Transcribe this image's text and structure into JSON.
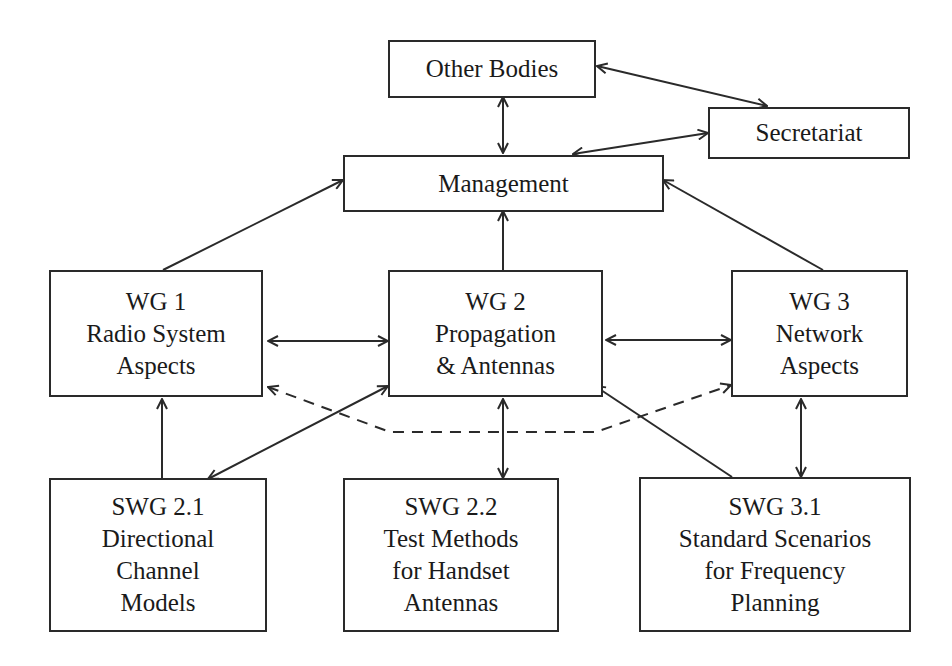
{
  "diagram": {
    "nodes": {
      "other_bodies": {
        "lines": [
          "Other Bodies"
        ]
      },
      "secretariat": {
        "lines": [
          "Secretariat"
        ]
      },
      "management": {
        "lines": [
          "Management"
        ]
      },
      "wg1": {
        "lines": [
          "WG 1",
          "Radio System",
          "Aspects"
        ]
      },
      "wg2": {
        "lines": [
          "WG 2",
          "Propagation",
          "& Antennas"
        ]
      },
      "wg3": {
        "lines": [
          "WG 3",
          "Network",
          "Aspects"
        ]
      },
      "swg21": {
        "lines": [
          "SWG 2.1",
          "Directional",
          "Channel",
          "Models"
        ]
      },
      "swg22": {
        "lines": [
          "SWG 2.2",
          "Test Methods",
          "for Handset",
          "Antennas"
        ]
      },
      "swg31": {
        "lines": [
          "SWG 3.1",
          "Standard Scenarios",
          "for Frequency",
          "Planning"
        ]
      }
    },
    "edges": [
      {
        "from": "Other Bodies",
        "to": "Secretariat",
        "style": "solid",
        "direction": "both"
      },
      {
        "from": "Other Bodies",
        "to": "Management",
        "style": "solid",
        "direction": "both"
      },
      {
        "from": "Secretariat",
        "to": "Management",
        "style": "solid",
        "direction": "both"
      },
      {
        "from": "WG 1",
        "to": "Management",
        "style": "solid",
        "direction": "forward"
      },
      {
        "from": "WG 2",
        "to": "Management",
        "style": "solid",
        "direction": "forward"
      },
      {
        "from": "WG 3",
        "to": "Management",
        "style": "solid",
        "direction": "forward"
      },
      {
        "from": "WG 1",
        "to": "WG 2",
        "style": "solid",
        "direction": "both"
      },
      {
        "from": "WG 2",
        "to": "WG 3",
        "style": "solid",
        "direction": "both"
      },
      {
        "from": "WG 1",
        "to": "WG 3",
        "style": "dashed",
        "direction": "both"
      },
      {
        "from": "SWG 2.1",
        "to": "WG 1",
        "style": "solid",
        "direction": "forward"
      },
      {
        "from": "SWG 2.1",
        "to": "WG 2",
        "style": "solid",
        "direction": "both"
      },
      {
        "from": "SWG 2.2",
        "to": "WG 2",
        "style": "solid",
        "direction": "both"
      },
      {
        "from": "SWG 3.1",
        "to": "WG 2",
        "style": "solid",
        "direction": "forward"
      },
      {
        "from": "SWG 3.1",
        "to": "WG 3",
        "style": "solid",
        "direction": "both"
      }
    ],
    "colors": {
      "stroke": "#2a2a2a",
      "background": "#ffffff"
    }
  }
}
